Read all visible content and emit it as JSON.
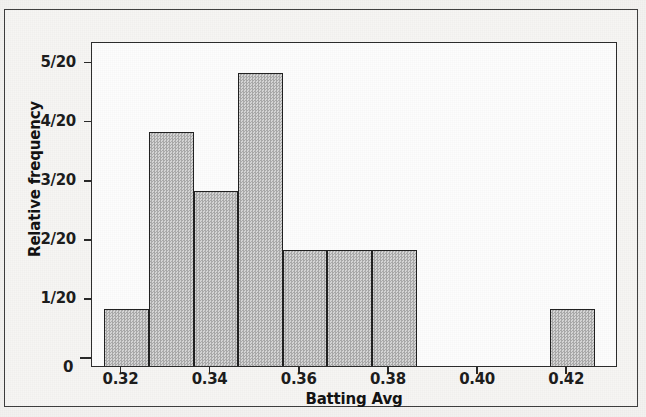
{
  "chart_data": {
    "type": "bar",
    "title": "",
    "subtitle": "",
    "xlabel": "Batting Avg",
    "ylabel": "Relative frequency",
    "grid": false,
    "legend": "none",
    "xlim": [
      0.3125,
      0.4305
    ],
    "ylim": [
      0,
      0.275
    ],
    "xticks": [
      0.32,
      0.34,
      0.36,
      0.38,
      0.4,
      0.42
    ],
    "xtick_labels": [
      "0.32",
      "0.34",
      "0.36",
      "0.38",
      "0.40",
      "0.42"
    ],
    "yticks": [
      0,
      0.05,
      0.1,
      0.15,
      0.2,
      0.25
    ],
    "ytick_labels": [
      "0",
      "1/20",
      "2/20",
      "3/20",
      "4/20",
      "5/20"
    ],
    "bin_width": 0.01,
    "n_total": 20,
    "bins": [
      {
        "left": 0.3153,
        "right": 0.3253,
        "count": 1,
        "label": "1/20",
        "value": 0.05
      },
      {
        "left": 0.3253,
        "right": 0.3353,
        "count": 4,
        "label": "4/20",
        "value": 0.2
      },
      {
        "left": 0.3353,
        "right": 0.3453,
        "count": 3,
        "label": "3/20",
        "value": 0.15
      },
      {
        "left": 0.3453,
        "right": 0.3553,
        "count": 5,
        "label": "5/20",
        "value": 0.25
      },
      {
        "left": 0.3553,
        "right": 0.3653,
        "count": 2,
        "label": "2/20",
        "value": 0.1
      },
      {
        "left": 0.3653,
        "right": 0.3753,
        "count": 2,
        "label": "2/20",
        "value": 0.1
      },
      {
        "left": 0.3753,
        "right": 0.3853,
        "count": 2,
        "label": "2/20",
        "value": 0.1
      },
      {
        "left": 0.3853,
        "right": 0.3953,
        "count": 0,
        "label": "0",
        "value": 0
      },
      {
        "left": 0.3953,
        "right": 0.4053,
        "count": 0,
        "label": "0",
        "value": 0
      },
      {
        "left": 0.4053,
        "right": 0.4153,
        "count": 0,
        "label": "0",
        "value": 0
      },
      {
        "left": 0.4153,
        "right": 0.4253,
        "count": 1,
        "label": "1/20",
        "value": 0.05
      }
    ],
    "categories": [
      "0.3153-0.3253",
      "0.3253-0.3353",
      "0.3353-0.3453",
      "0.3453-0.3553",
      "0.3553-0.3653",
      "0.3653-0.3753",
      "0.3753-0.3853",
      "0.3853-0.3953",
      "0.3953-0.4053",
      "0.4053-0.4153",
      "0.4153-0.4253"
    ],
    "values": [
      0.05,
      0.2,
      0.15,
      0.25,
      0.1,
      0.1,
      0.1,
      0,
      0,
      0,
      0.05
    ],
    "counts": [
      1,
      4,
      3,
      5,
      2,
      2,
      2,
      0,
      0,
      0,
      1
    ]
  },
  "colors": {
    "bar_fill": "#bdbdbd",
    "bar_edge": "#1e1e1e",
    "plot_background": "#fdfdfd",
    "page_background": "#f3f2f0",
    "frame": "#3d3d3d",
    "text": "#101010"
  },
  "axis": {
    "x_title": "Batting Avg",
    "y_title": "Relative frequency",
    "y_zero_label": "0"
  }
}
